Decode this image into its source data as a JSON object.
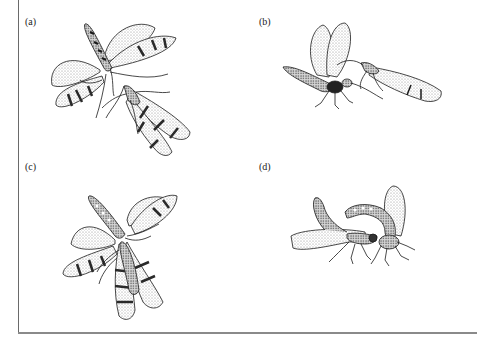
{
  "figure": {
    "panels": [
      {
        "id": "a",
        "label": "(a)",
        "description": "Two insects facing each other; upper with wings spread, lower with wings folded"
      },
      {
        "id": "b",
        "label": "(b)",
        "description": "Male with wings raised approaching female with wings folded back"
      },
      {
        "id": "c",
        "label": "(c)",
        "description": "Two insects overlapping, one with spread wings above one with folded wings"
      },
      {
        "id": "d",
        "label": "(d)",
        "description": "Pair in copulation, male abdomen curled up"
      }
    ]
  },
  "colors": {
    "ink": "#1a1a1a",
    "stipple": "#9a9a9a",
    "frame": "#6a6a6a",
    "background": "#ffffff"
  }
}
